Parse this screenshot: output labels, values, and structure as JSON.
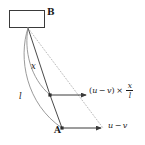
{
  "figure": {
    "type": "vector-decomposition-diagram",
    "background_color": "#ffffff",
    "ink_color": "#1a1a1a",
    "line_color": "#555555",
    "arc_color": "#8a8a8a",
    "dotted_color": "#b5b5b5"
  },
  "labels": {
    "point_b": "B",
    "point_a": "A",
    "distance_x": "x",
    "distance_l": "l"
  },
  "expressions": {
    "scaled_vector": {
      "open_paren": "(",
      "u": "u",
      "minus": "−",
      "v": "v",
      "close_paren": ")",
      "times": "×",
      "fraction_numerator": "x",
      "fraction_denominator": "l",
      "plain_text": "(u − v) × x/l"
    },
    "base_vector": {
      "u": "u",
      "minus": "−",
      "v": "v",
      "plain_text": "u − v"
    }
  },
  "geometry": {
    "box_b": {
      "x": 9,
      "y": 10,
      "width": 36,
      "height": 18
    },
    "vertex_b": {
      "x": 28,
      "y": 28
    },
    "point_mid": {
      "x": 50,
      "y": 95
    },
    "point_a": {
      "x": 62,
      "y": 128
    },
    "arrow_mid_tip": {
      "x": 88,
      "y": 95
    },
    "arrow_a_tip": {
      "x": 103,
      "y": 128
    }
  }
}
